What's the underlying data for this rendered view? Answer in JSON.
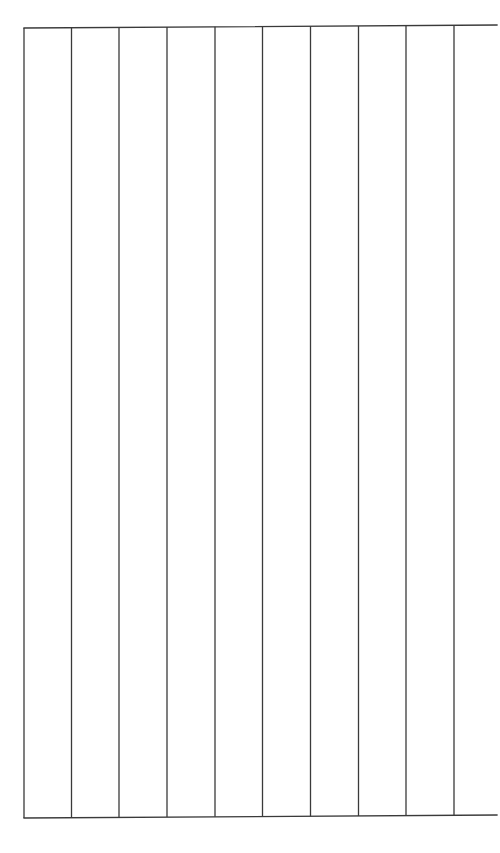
{
  "page": {
    "background": "#ffffff",
    "line_color": "#3a3a3a",
    "line_width": 1.3
  },
  "grid": {
    "type": "ruled-column-grid",
    "column_count": 10,
    "top_line": {
      "x1": 24,
      "y1": 28,
      "x2": 497,
      "y2": 25
    },
    "bottom_line": {
      "x1": 24,
      "y1": 818,
      "x2": 497,
      "y2": 815
    },
    "vertical_lines_x": [
      24,
      71.5,
      119,
      167,
      215,
      262.5,
      310.5,
      358.5,
      406,
      454
    ],
    "right_border": false
  }
}
